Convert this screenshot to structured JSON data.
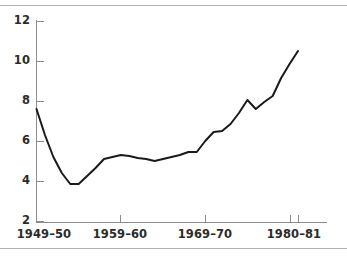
{
  "chart_data": {
    "type": "line",
    "title": "",
    "subtitle": "",
    "xlabel": "",
    "ylabel": "",
    "grid": false,
    "legend": "none",
    "legend_entries": [],
    "annotations": [],
    "line_color": "#1a1a1a",
    "axis_color": "#8c8c8c",
    "background_color": "#ffffff",
    "ylim": [
      2,
      12
    ],
    "ytick_labels": [
      "12",
      "10",
      "8",
      "6",
      "4",
      "2"
    ],
    "ytick_values": [
      12,
      10,
      8,
      6,
      4,
      2
    ],
    "xtick_labels": [
      "1949–50",
      "1959–60",
      "1969–70",
      "1980–81"
    ],
    "xtick_values": [
      1949,
      1959,
      1969,
      1980
    ],
    "x": [
      "1949-50",
      "1950-51",
      "1951-52",
      "1952-53",
      "1953-54",
      "1954-55",
      "1955-56",
      "1956-57",
      "1957-58",
      "1958-59",
      "1959-60",
      "1960-61",
      "1961-62",
      "1962-63",
      "1963-64",
      "1964-65",
      "1965-66",
      "1966-67",
      "1967-68",
      "1968-69",
      "1969-70",
      "1970-71",
      "1971-72",
      "1972-73",
      "1973-74",
      "1974-75",
      "1975-76",
      "1976-77",
      "1977-78",
      "1978-79",
      "1979-80",
      "1980-81"
    ],
    "values": [
      7.6,
      6.3,
      5.2,
      4.4,
      3.85,
      3.85,
      4.25,
      4.65,
      5.1,
      5.2,
      5.3,
      5.25,
      5.15,
      5.1,
      5.0,
      5.1,
      5.2,
      5.3,
      5.45,
      5.45,
      6.0,
      6.45,
      6.5,
      6.85,
      7.4,
      8.05,
      7.6,
      7.95,
      8.25,
      9.15,
      9.85,
      10.5
    ]
  },
  "chart": {
    "axis": {
      "y_axis_name": "y-axis",
      "x_axis_name": "x-axis"
    }
  }
}
